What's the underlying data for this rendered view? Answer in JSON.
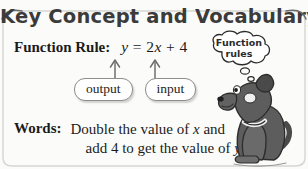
{
  "banner": {
    "title": "Key Concept and Vocabulary",
    "swoosh_left_icon": "swoosh-left-icon",
    "swoosh_right_icon": "swoosh-right-icon"
  },
  "function_rule": {
    "label": "Function Rule:",
    "equation_lhs": "y",
    "equation_eq": "=",
    "equation_coef": "2",
    "equation_var": "x",
    "equation_plus": "+",
    "equation_const": "4",
    "equation_full": "y = 2x + 4"
  },
  "callouts": {
    "output_label": "output",
    "input_label": "input",
    "output_arrow_icon": "up-arrow-icon",
    "input_arrow_icon": "up-arrow-icon"
  },
  "words": {
    "label": "Words:",
    "line1_a": "Double the value of ",
    "line1_var": "x",
    "line1_b": " and",
    "line2_a": "add 4 to get the value of ",
    "line2_var": "y",
    "line2_b": ".",
    "full_text": "Double the value of x and add 4 to get the value of y."
  },
  "illustration": {
    "thought_line1": "Function",
    "thought_line2": "rules",
    "dog_icon": "dog-icon",
    "thought_bubble_icon": "thought-bubble-icon"
  },
  "colors": {
    "background": "#fbfbf9",
    "title_text": "#3b3b3b",
    "body_text": "#1b1b1b",
    "callout_border": "#8d8d8d",
    "dog_body": "#5a5a5a",
    "frame_line": "#cfcfcb"
  }
}
